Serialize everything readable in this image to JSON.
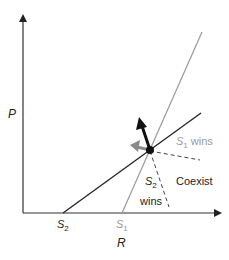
{
  "axes": {
    "y_label": "P",
    "x_label": "R",
    "x_ticks": [
      {
        "main": "S",
        "sub": "2",
        "color": "#222222"
      },
      {
        "main": "S",
        "sub": "1",
        "color": "#9a9a9a"
      }
    ]
  },
  "regions": {
    "s1_wins": {
      "main": "S",
      "sub": "1",
      "suffix": " wins",
      "color": "#9a9a9a"
    },
    "s2_wins": {
      "main": "S",
      "sub": "2",
      "line2": "wins",
      "color": "#222222"
    },
    "coexist": "Coexist"
  },
  "colors": {
    "s1_line": "#9a9a9a",
    "s2_line": "#222222",
    "axis": "#333333",
    "impact_s2_arrow": "#111111",
    "impact_s1_arrow": "#8a8a8a"
  }
}
